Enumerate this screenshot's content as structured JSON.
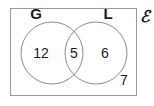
{
  "figure": {
    "type": "venn-diagram",
    "universe": {
      "symbol": "ℰ",
      "description": "universal-set-label"
    },
    "sets": [
      {
        "id": "G",
        "label": "G",
        "only_count": "12"
      },
      {
        "id": "L",
        "label": "L",
        "only_count": "6"
      }
    ],
    "regions": {
      "g_only": "12",
      "intersection": "5",
      "l_only": "6",
      "outside": "7"
    },
    "colors": {
      "background": "#ffffff",
      "rect_stroke": "#9a9a9a",
      "circle_stroke": "#8c8c8c",
      "text": "#1a1a1a"
    }
  }
}
